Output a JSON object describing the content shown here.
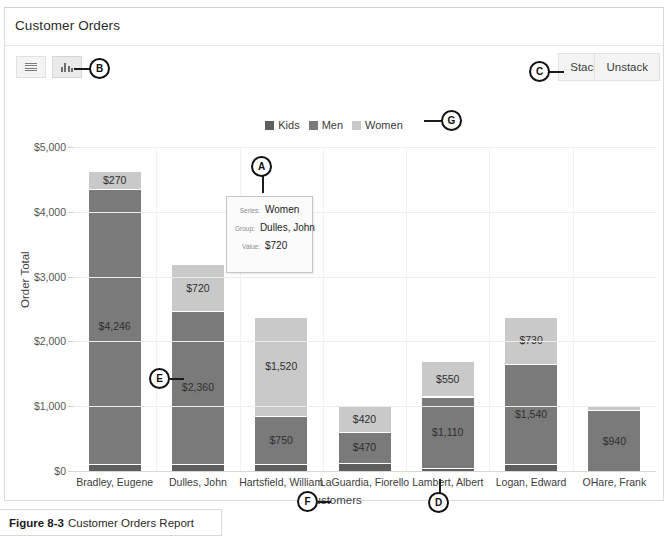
{
  "window": {
    "title": "Customer Orders"
  },
  "toolbar": {
    "list_view_icon": "hamburger-menu-icon",
    "chart_view_icon": "bar-chart-icon",
    "stack_label": "Stack",
    "unstack_label": "Unstack"
  },
  "legend": {
    "position": "top-center",
    "items": [
      {
        "label": "Kids",
        "color": "#5e5e5e"
      },
      {
        "label": "Men",
        "color": "#7a7a7a"
      },
      {
        "label": "Women",
        "color": "#c9c9c9"
      }
    ]
  },
  "tooltip": {
    "series_key": "Series:",
    "series_value": "Women",
    "group_key": "Group:",
    "group_value": "Dulles, John",
    "value_key": "Value:",
    "value_value": "$720"
  },
  "callouts": [
    {
      "letter": "A",
      "target": "tooltip"
    },
    {
      "letter": "B",
      "target": "chart-view-toggle-button"
    },
    {
      "letter": "C",
      "target": "stack-button"
    },
    {
      "letter": "D",
      "target": "x-axis-tick-label"
    },
    {
      "letter": "E",
      "target": "bar-segment-data-label"
    },
    {
      "letter": "F",
      "target": "x-axis-title"
    },
    {
      "letter": "G",
      "target": "legend"
    }
  ],
  "caption": {
    "figure_number": "Figure 8-3",
    "text": "Customer Orders Report"
  },
  "chart_data": {
    "type": "bar",
    "subtype": "stacked-column",
    "title": "Customer Orders",
    "xlabel": "Customers",
    "ylabel": "Order Total",
    "ylim": [
      0,
      5000
    ],
    "yticks": [
      0,
      1000,
      2000,
      3000,
      4000,
      5000
    ],
    "ytick_labels": [
      "$0",
      "$1,000",
      "$2,000",
      "$3,000",
      "$4,000",
      "$5,000"
    ],
    "grid": true,
    "legend_position": "top-center",
    "categories": [
      "Bradley, Eugene",
      "Dulles, John",
      "Hartsfield, William",
      "LaGuardia, Fiorello",
      "Lambert, Albert",
      "Logan, Edward",
      "OHare, Frank"
    ],
    "series": [
      {
        "name": "Kids",
        "color": "#5e5e5e",
        "values": [
          110,
          110,
          105,
          130,
          40,
          110,
          0
        ],
        "labels": [
          "",
          "",
          "",
          "",
          "",
          "",
          ""
        ]
      },
      {
        "name": "Men",
        "color": "#7a7a7a",
        "values": [
          4246,
          2360,
          750,
          470,
          1110,
          1540,
          940
        ],
        "labels": [
          "$4,246",
          "$2,360",
          "$750",
          "$470",
          "$1,110",
          "$1,540",
          "$940"
        ]
      },
      {
        "name": "Women",
        "color": "#c9c9c9",
        "values": [
          270,
          720,
          1520,
          420,
          550,
          730,
          60
        ],
        "labels": [
          "$270",
          "$720",
          "$1,520",
          "$420",
          "$550",
          "$730",
          ""
        ]
      }
    ]
  }
}
